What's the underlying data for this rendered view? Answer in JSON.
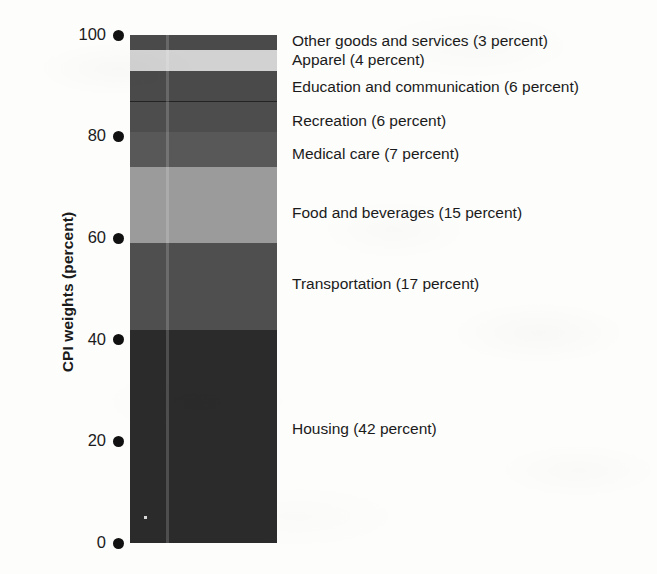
{
  "chart_data": {
    "type": "bar",
    "title": "",
    "subtitle": "",
    "xlabel": "",
    "ylabel": "CPI weights (percent)",
    "ylim": [
      0,
      100
    ],
    "yticks": [
      0,
      20,
      40,
      60,
      80,
      100
    ],
    "ytick_labels": [
      "0",
      "20",
      "40",
      "60",
      "80",
      "100"
    ],
    "grid": false,
    "legend_position": "right-inline-labels",
    "stacked": true,
    "categories": [
      "CPI"
    ],
    "orientation": "vertical",
    "annotations": [],
    "series": [
      {
        "name": "Housing",
        "label": "Housing (42 percent)",
        "value": 42,
        "color": "#2b2b2b",
        "cumulative_bottom": 0,
        "cumulative_top": 42
      },
      {
        "name": "Transportation",
        "label": "Transportation (17 percent)",
        "value": 17,
        "color": "#4f4f4f",
        "cumulative_bottom": 42,
        "cumulative_top": 59
      },
      {
        "name": "Food and beverages",
        "label": "Food and beverages (15 percent)",
        "value": 15,
        "color": "#9b9b9b",
        "cumulative_bottom": 59,
        "cumulative_top": 74
      },
      {
        "name": "Medical care",
        "label": "Medical care (7 percent)",
        "value": 7,
        "color": "#585858",
        "cumulative_bottom": 74,
        "cumulative_top": 81
      },
      {
        "name": "Recreation",
        "label": "Recreation (6 percent)",
        "value": 6,
        "color": "#4d4d4d",
        "cumulative_bottom": 81,
        "cumulative_top": 87
      },
      {
        "name": "Education and communication",
        "label": "Education and communication (6 percent)",
        "value": 6,
        "color": "#4a4a4a",
        "cumulative_bottom": 87,
        "cumulative_top": 93
      },
      {
        "name": "Apparel",
        "label": "Apparel (4 percent)",
        "value": 4,
        "color": "#d2d2d2",
        "cumulative_bottom": 93,
        "cumulative_top": 97
      },
      {
        "name": "Other goods and services",
        "label": "Other goods and services (3 percent)",
        "value": 3,
        "color": "#4a4a4a",
        "cumulative_bottom": 97,
        "cumulative_top": 100
      }
    ]
  },
  "axis": {
    "y_title": "CPI weights (percent)",
    "ticks": [
      {
        "value": 100,
        "label": "100"
      },
      {
        "value": 80,
        "label": "80"
      },
      {
        "value": 60,
        "label": "60"
      },
      {
        "value": 40,
        "label": "40"
      },
      {
        "value": 20,
        "label": "20"
      },
      {
        "value": 0,
        "label": "0"
      }
    ]
  },
  "labels": [
    {
      "text": "Other goods and services (3 percent)",
      "top": 33
    },
    {
      "text": "Apparel (4 percent)",
      "top": 52
    },
    {
      "text": "Education and communication (6 percent)",
      "top": 79
    },
    {
      "text": "Recreation (6 percent)",
      "top": 113
    },
    {
      "text": "Medical care (7 percent)",
      "top": 146
    },
    {
      "text": "Food and beverages (15 percent)",
      "top": 205
    },
    {
      "text": "Transportation (17 percent)",
      "top": 276
    },
    {
      "text": "Housing (42 percent)",
      "top": 421
    }
  ],
  "colors": {
    "background": "#fdfdfb",
    "text": "#1b1b1b",
    "tick_marker": "#111111"
  }
}
